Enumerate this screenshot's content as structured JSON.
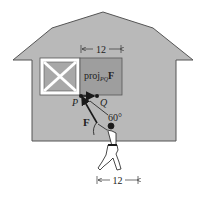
{
  "figure": {
    "type": "vector projection illustration",
    "colors": {
      "building_fill": "#b9b9b9",
      "building_stroke": "#555555",
      "window_frame": "#ffffff",
      "window_pane": "#a8a8a8",
      "projection_fill": "#9e9e9e",
      "ink": "#1a1a1a"
    },
    "labels": {
      "top_dimension": "12",
      "projection": "proj",
      "projection_subscript": "PQ",
      "projection_vector": "F",
      "point_p": "P",
      "point_q": "Q",
      "angle": "60°",
      "force": "F",
      "bottom_dimension": "12"
    }
  }
}
